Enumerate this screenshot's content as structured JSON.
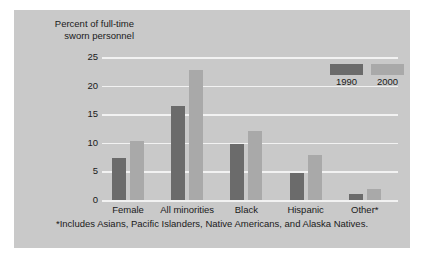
{
  "chart_data": {
    "type": "bar",
    "title": "",
    "subtitle": "",
    "xlabel": "",
    "ylabel": "Percent of full-time\nsworn personnel",
    "categories": [
      "Female",
      "All minorities",
      "Black",
      "Hispanic",
      "Other*"
    ],
    "series": [
      {
        "name": "1990",
        "color": "#6b6b6b",
        "values": [
          7.4,
          16.5,
          9.8,
          4.7,
          1.0
        ]
      },
      {
        "name": "2000",
        "color": "#a9a9a9",
        "values": [
          10.4,
          22.8,
          12.0,
          7.9,
          2.0
        ]
      }
    ],
    "ylim": [
      0,
      25
    ],
    "yticks": [
      0,
      5,
      10,
      15,
      20,
      25
    ],
    "ytick_labels": [
      "0",
      "5",
      "10",
      "15",
      "20",
      "25"
    ],
    "grid": true,
    "grid_color": "#f2f2f2",
    "legend_position": "top-right",
    "background_color": "#c9c9c9",
    "annotations": [
      "*Includes Asians, Pacific Islanders, Native Americans, and Alaska Natives."
    ]
  },
  "figure": {
    "axis_title": "Percent of full-time\nsworn personnel",
    "footnote": "*Includes Asians, Pacific Islanders, Native Americans, and Alaska Natives."
  }
}
